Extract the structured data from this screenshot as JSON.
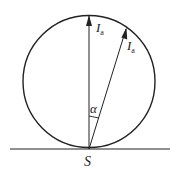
{
  "diagram": {
    "labels": {
      "vertical_vector": {
        "main": "I",
        "sub": "a"
      },
      "slanted_vector": {
        "main": "I",
        "sub": "a"
      },
      "angle": "α",
      "point": "S"
    },
    "colors": {
      "stroke": "#222222",
      "background": "#ffffff"
    }
  }
}
